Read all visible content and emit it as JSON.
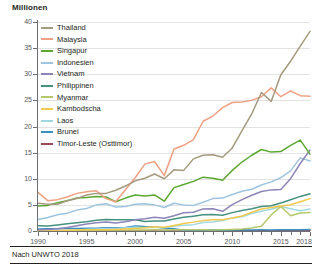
{
  "axis_title": "Millionen",
  "source": "Nach UNWTO 2018",
  "chart_data": {
    "type": "line",
    "title": "",
    "subtitle": "",
    "xlabel": "",
    "ylabel": "Millionen",
    "xlim": [
      1990,
      2018
    ],
    "ylim": [
      0,
      40
    ],
    "ytick_labels": [
      "0",
      "5",
      "10",
      "15",
      "20",
      "25",
      "30",
      "35",
      "40"
    ],
    "yticks": [
      0,
      5,
      10,
      15,
      20,
      25,
      30,
      35,
      40
    ],
    "xtick_labels": [
      "1990",
      "1995",
      "2000",
      "2005",
      "2010",
      "2015",
      "2018"
    ],
    "xticks": [
      1990,
      1995,
      2000,
      2005,
      2010,
      2015,
      2018
    ],
    "x_minor_ticks_every": 1,
    "grid": "horizontal",
    "legend_position": "top-left-inside",
    "annotation": "Nach UNWTO 2018",
    "x": [
      1990,
      1991,
      1992,
      1993,
      1994,
      1995,
      1996,
      1997,
      1998,
      1999,
      2000,
      2001,
      2002,
      2003,
      2004,
      2005,
      2006,
      2007,
      2008,
      2009,
      2010,
      2011,
      2012,
      2013,
      2014,
      2015,
      2016,
      2017,
      2018
    ],
    "series": [
      {
        "name": "Thailand",
        "color": "#a59a7e",
        "values": [
          5.3,
          5.1,
          5.1,
          5.8,
          6.2,
          6.9,
          7.2,
          7.2,
          7.8,
          8.6,
          9.6,
          10.1,
          10.9,
          10.0,
          11.7,
          11.6,
          13.8,
          14.5,
          14.6,
          14.1,
          15.9,
          19.2,
          22.4,
          26.5,
          24.8,
          29.9,
          32.5,
          35.4,
          38.2
        ]
      },
      {
        "name": "Malaysia",
        "color": "#efa083",
        "values": [
          7.4,
          5.8,
          6.0,
          6.5,
          7.2,
          7.5,
          7.7,
          6.2,
          5.6,
          7.9,
          10.2,
          12.8,
          13.3,
          10.6,
          15.7,
          16.4,
          17.5,
          21.0,
          22.0,
          23.6,
          24.6,
          24.7,
          25.0,
          25.7,
          27.4,
          25.7,
          26.8,
          25.9,
          25.8
        ]
      },
      {
        "name": "Singapur",
        "color": "#5aa832",
        "values": [
          4.8,
          4.9,
          5.4,
          5.8,
          6.3,
          6.4,
          6.6,
          6.5,
          5.6,
          6.3,
          6.9,
          6.7,
          6.9,
          5.7,
          8.3,
          8.9,
          9.5,
          10.3,
          10.1,
          9.7,
          11.6,
          13.2,
          14.5,
          15.6,
          15.1,
          15.2,
          16.4,
          17.4,
          14.7
        ]
      },
      {
        "name": "Indonesien",
        "color": "#9ec4e0",
        "values": [
          2.2,
          2.6,
          3.1,
          3.4,
          4.0,
          4.3,
          5.0,
          5.2,
          4.6,
          4.7,
          5.1,
          5.2,
          5.0,
          4.5,
          5.3,
          5.0,
          4.9,
          5.5,
          6.2,
          6.3,
          7.0,
          7.6,
          8.0,
          8.8,
          9.4,
          10.2,
          11.5,
          14.0,
          13.4
        ]
      },
      {
        "name": "Vietnam",
        "color": "#8d85b8",
        "values": [
          0.25,
          0.3,
          0.44,
          0.67,
          1.02,
          1.35,
          1.6,
          1.72,
          1.52,
          1.78,
          2.14,
          2.33,
          2.63,
          2.43,
          2.93,
          3.48,
          3.58,
          4.23,
          4.24,
          3.77,
          5.05,
          6.01,
          6.85,
          7.57,
          7.87,
          7.94,
          10.01,
          12.92,
          15.5
        ]
      },
      {
        "name": "Philippinen",
        "color": "#46917f",
        "values": [
          1.02,
          0.95,
          1.15,
          1.37,
          1.57,
          1.76,
          2.05,
          2.22,
          2.15,
          2.17,
          2.17,
          1.8,
          1.93,
          1.91,
          2.29,
          2.62,
          2.84,
          3.09,
          3.14,
          3.02,
          3.52,
          3.92,
          4.27,
          4.68,
          4.83,
          5.36,
          5.97,
          6.62,
          7.13
        ]
      },
      {
        "name": "Myanmar",
        "color": "#b5c96b",
        "values": [
          0.02,
          0.02,
          0.02,
          0.04,
          0.05,
          0.11,
          0.17,
          0.19,
          0.2,
          0.2,
          0.21,
          0.2,
          0.22,
          0.21,
          0.24,
          0.23,
          0.26,
          0.25,
          0.19,
          0.24,
          0.31,
          0.39,
          0.59,
          0.9,
          3.08,
          4.68,
          2.91,
          3.44,
          3.55
        ]
      },
      {
        "name": "Kambodscha",
        "color": "#f2c94c",
        "values": [
          0.02,
          0.03,
          0.05,
          0.12,
          0.18,
          0.22,
          0.26,
          0.22,
          0.29,
          0.37,
          0.47,
          0.6,
          0.79,
          0.7,
          1.06,
          1.42,
          1.7,
          2.02,
          2.13,
          2.16,
          2.51,
          2.88,
          3.58,
          4.21,
          4.5,
          4.78,
          5.01,
          5.6,
          6.2
        ]
      },
      {
        "name": "Laos",
        "color": "#9fd8e0",
        "values": [
          0.01,
          0.04,
          0.06,
          0.1,
          0.15,
          0.35,
          0.4,
          0.46,
          0.5,
          0.61,
          0.74,
          0.67,
          0.74,
          0.64,
          0.89,
          1.1,
          1.22,
          1.62,
          1.74,
          2.01,
          2.51,
          2.72,
          3.33,
          3.78,
          4.16,
          4.68,
          4.24,
          3.87,
          4.19
        ]
      },
      {
        "name": "Brunei",
        "color": "#3a8fc4",
        "values": [
          0.38,
          0.42,
          0.45,
          0.47,
          0.5,
          0.52,
          0.55,
          0.64,
          0.64,
          0.65,
          0.98,
          0.84,
          0.79,
          0.52,
          0.42,
          0.13,
          0.16,
          0.18,
          0.23,
          0.16,
          0.21,
          0.24,
          0.21,
          0.22,
          0.2,
          0.22,
          0.22,
          0.26,
          0.28
        ]
      },
      {
        "name": "Timor-Leste (Osttimor)",
        "color": "#9e4a52",
        "values": [
          0.0,
          0.0,
          0.0,
          0.0,
          0.0,
          0.0,
          0.0,
          0.0,
          0.0,
          0.0,
          0.0,
          0.0,
          0.0,
          0.01,
          0.01,
          0.01,
          0.01,
          0.02,
          0.03,
          0.04,
          0.04,
          0.05,
          0.06,
          0.06,
          0.06,
          0.06,
          0.07,
          0.07,
          0.08
        ]
      }
    ]
  }
}
